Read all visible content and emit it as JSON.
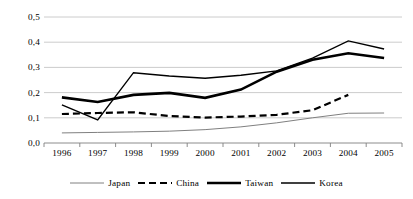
{
  "chart_data": {
    "type": "line",
    "title": "",
    "subtitle": "",
    "xlabel": "",
    "ylabel": "",
    "categories": [
      "1996",
      "1997",
      "1998",
      "1999",
      "2000",
      "2001",
      "2002",
      "2003",
      "2004",
      "2005"
    ],
    "ylim": [
      0.0,
      0.5
    ],
    "ytick_labels": [
      "0,0",
      "0,1",
      "0,2",
      "0,3",
      "0,4",
      "0,5"
    ],
    "ytick_values": [
      0.0,
      0.1,
      0.2,
      0.3,
      0.4,
      0.5
    ],
    "grid": "horizontal",
    "grid_color": "#bfbfbf",
    "legend_position": "bottom",
    "series": [
      {
        "name": "Japan",
        "style": "thin-solid",
        "color": "#808080",
        "width": 1.0,
        "values": [
          0.04,
          0.042,
          0.044,
          0.047,
          0.053,
          0.064,
          0.08,
          0.1,
          0.118,
          0.119
        ]
      },
      {
        "name": "China",
        "style": "dashed",
        "color": "#000000",
        "width": 2.2,
        "values": [
          0.115,
          0.119,
          0.122,
          0.107,
          0.101,
          0.105,
          0.112,
          0.13,
          0.191,
          null
        ]
      },
      {
        "name": "Taiwan",
        "style": "thick-solid",
        "color": "#000000",
        "width": 2.6,
        "values": [
          0.181,
          0.163,
          0.191,
          0.199,
          0.179,
          0.212,
          0.283,
          0.33,
          0.356,
          0.337
        ]
      },
      {
        "name": "Korea",
        "style": "medium-solid",
        "color": "#000000",
        "width": 1.4,
        "values": [
          0.151,
          0.092,
          0.279,
          0.266,
          0.257,
          0.269,
          0.286,
          0.337,
          0.405,
          0.373
        ]
      }
    ]
  },
  "legend": {
    "entries": [
      {
        "label": "Japan"
      },
      {
        "label": "China"
      },
      {
        "label": "Taiwan"
      },
      {
        "label": "Korea"
      }
    ]
  }
}
